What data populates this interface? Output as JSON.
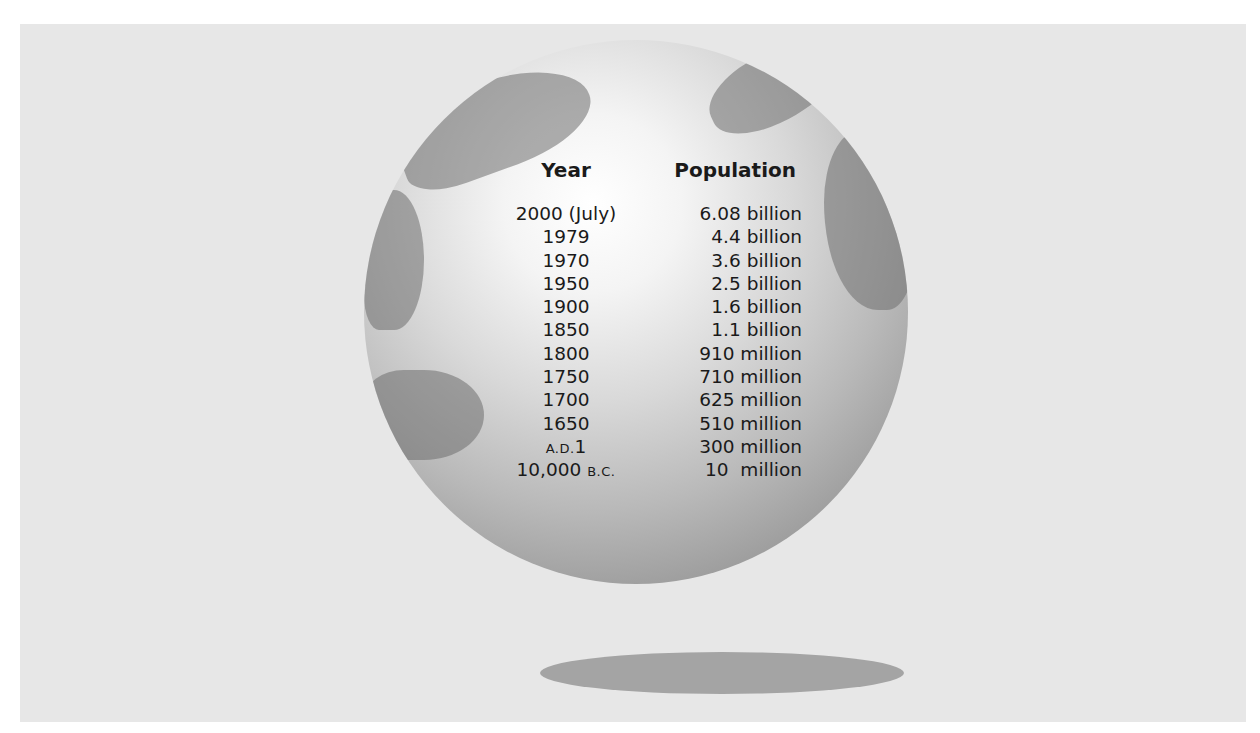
{
  "table": {
    "headers": {
      "year": "Year",
      "population": "Population"
    },
    "rows": [
      {
        "year": "2000 (July)",
        "population": "6.08 billion"
      },
      {
        "year": "1979",
        "population": "4.4 billion"
      },
      {
        "year": "1970",
        "population": "3.6 billion"
      },
      {
        "year": "1950",
        "population": "2.5 billion"
      },
      {
        "year": "1900",
        "population": "1.6 billion"
      },
      {
        "year": "1850",
        "population": "1.1 billion"
      },
      {
        "year": "1800",
        "population": "910 million"
      },
      {
        "year": "1750",
        "population": "710 million"
      },
      {
        "year": "1700",
        "population": "625 million"
      },
      {
        "year": "1650",
        "population": "510 million"
      },
      {
        "year_prefix": "A.D.",
        "year": "1",
        "population": "300 million"
      },
      {
        "year": "10,000",
        "year_suffix": "B.C.",
        "population": "10  million"
      }
    ]
  },
  "colors": {
    "panel": "#e7e7e7",
    "globe_highlight": "#ffffff",
    "globe_edge": "#8a8a8a",
    "shadow": "#a4a4a4",
    "text": "#1a1a1a"
  }
}
